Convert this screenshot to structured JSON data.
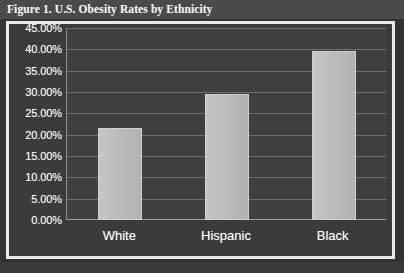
{
  "figure": {
    "title": "Figure 1. U.S. Obesity Rates by Ethnicity"
  },
  "colors": {
    "background": "#3b3b3b",
    "plot_background": "#404040",
    "bar_fill": "#bcbcbc",
    "text": "#ffffff",
    "gridline": "#6e6e6e",
    "frame": "#e9e9e9",
    "title_band": "#4a4a4a"
  },
  "chart_data": {
    "type": "bar",
    "title": "Figure 1. U.S. Obesity Rates by Ethnicity",
    "xlabel": "",
    "ylabel": "",
    "categories": [
      "White",
      "Hispanic",
      "Black"
    ],
    "values": [
      21.5,
      29.5,
      39.5
    ],
    "ylim": [
      0,
      45
    ],
    "ytick_values": [
      0,
      5,
      10,
      15,
      20,
      25,
      30,
      35,
      40,
      45
    ],
    "ytick_labels": [
      "0.00%",
      "5.00%",
      "10.00%",
      "15.00%",
      "20.00%",
      "25.00%",
      "30.00%",
      "35.00%",
      "40.00%",
      "45.00%"
    ],
    "grid": true,
    "legend": false,
    "legend_position": "none",
    "value_labels": false,
    "series": [
      {
        "name": "Obesity Rate",
        "values": [
          21.5,
          29.5,
          39.5
        ]
      }
    ]
  }
}
